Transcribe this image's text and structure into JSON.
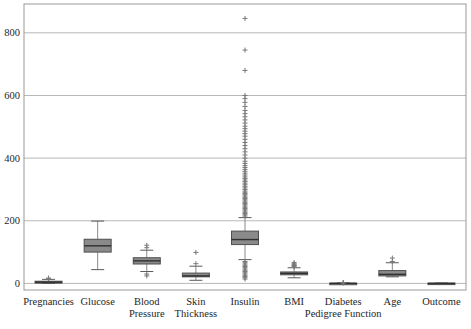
{
  "figure": {
    "title": "",
    "background": "#ffffff"
  },
  "colors": {
    "frame": "#999999",
    "gridline": "#b8b8b8",
    "box_fill": "#8a8a8a",
    "box_stroke": "#4f4f4f",
    "median": "#2f2f2f",
    "whisker": "#8a8a8a",
    "cap": "#5a5a5a",
    "outlier": "#787878",
    "text": "#262626"
  },
  "chart_data": {
    "type": "boxplot",
    "title": "",
    "xlabel": "",
    "ylabel": "",
    "grid": true,
    "legend": null,
    "ylim": [
      -21,
      892
    ],
    "yticks": [
      0,
      200,
      400,
      600,
      800
    ],
    "categories": [
      "Pregnancies",
      "Glucose",
      "Blood Pressure",
      "Skin Thickness",
      "Insulin",
      "BMI",
      "Diabetes Pedigree Function",
      "Age",
      "Outcome"
    ],
    "series": [
      {
        "name": "pregnancies",
        "label_lines": [
          "Pregnancies"
        ],
        "whisker_low": 0,
        "q1": 1,
        "median": 4,
        "q3": 7,
        "whisker_high": 13,
        "outliers_low": [],
        "outliers_high": [
          15,
          17
        ]
      },
      {
        "name": "glucose",
        "label_lines": [
          "Glucose"
        ],
        "whisker_low": 44,
        "q1": 100,
        "median": 120,
        "q3": 141,
        "whisker_high": 199,
        "outliers_low": [],
        "outliers_high": []
      },
      {
        "name": "blood-pressure",
        "label_lines": [
          "Blood",
          "Pressure"
        ],
        "whisker_low": 38,
        "q1": 62,
        "median": 72,
        "q3": 82,
        "whisker_high": 106,
        "outliers_low": [
          24,
          30
        ],
        "outliers_high": [
          114,
          122
        ]
      },
      {
        "name": "skin-thickness",
        "label_lines": [
          "Skin",
          "Thickness"
        ],
        "whisker_low": 10,
        "q1": 21,
        "median": 24,
        "q3": 33,
        "whisker_high": 55,
        "outliers_low": [],
        "outliers_high": [
          63,
          99
        ]
      },
      {
        "name": "insulin",
        "label_lines": [
          "Insulin"
        ],
        "whisker_low": 76,
        "q1": 124,
        "median": 140,
        "q3": 167,
        "whisker_high": 210,
        "outliers_low": [
          14,
          18,
          22,
          26,
          30,
          34,
          38,
          42,
          46,
          50,
          54,
          58,
          62,
          66,
          70
        ],
        "outliers_high": [
          215,
          219,
          223,
          227,
          231,
          235,
          239,
          243,
          247,
          251,
          255,
          259,
          263,
          267,
          271,
          275,
          279,
          283,
          287,
          291,
          295,
          300,
          305,
          310,
          315,
          320,
          325,
          330,
          335,
          340,
          346,
          352,
          358,
          364,
          370,
          376,
          383,
          390,
          400,
          410,
          420,
          430,
          440,
          450,
          460,
          470,
          478,
          486,
          494,
          502,
          512,
          522,
          532,
          542,
          552,
          565,
          578,
          590,
          600,
          680,
          745,
          846
        ]
      },
      {
        "name": "bmi",
        "label_lines": [
          "BMI"
        ],
        "whisker_low": 18,
        "q1": 27.5,
        "median": 32,
        "q3": 36.6,
        "whisker_high": 50,
        "outliers_low": [],
        "outliers_high": [
          53,
          55,
          57,
          60,
          63,
          67
        ]
      },
      {
        "name": "diabetes-pedigree-function",
        "label_lines": [
          "Diabetes",
          "Pedigree Function"
        ],
        "whisker_low": 0.08,
        "q1": 0.24,
        "median": 0.37,
        "q3": 0.63,
        "whisker_high": 1.2,
        "outliers_low": [],
        "outliers_high": [
          1.6,
          2.0,
          2.42
        ]
      },
      {
        "name": "age",
        "label_lines": [
          "Age"
        ],
        "whisker_low": 21,
        "q1": 24,
        "median": 29,
        "q3": 41,
        "whisker_high": 66,
        "outliers_low": [],
        "outliers_high": [
          70,
          81
        ]
      },
      {
        "name": "outcome",
        "label_lines": [
          "Outcome"
        ],
        "whisker_low": 0,
        "q1": 0,
        "median": 0,
        "q3": 1,
        "whisker_high": 1,
        "outliers_low": [],
        "outliers_high": []
      }
    ]
  }
}
